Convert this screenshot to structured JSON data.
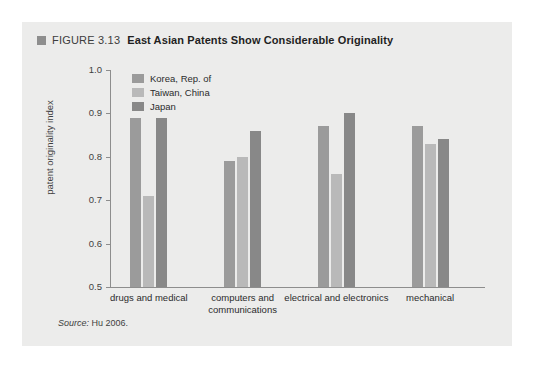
{
  "figure": {
    "label": "FIGURE 3.13",
    "title": "East Asian Patents Show Considerable Originality",
    "marker_color": "#8e8e8e"
  },
  "source": {
    "prefix": "Source:",
    "text": "Hu 2006."
  },
  "colors": {
    "panel_background": "#ececeb",
    "page_background": "#ffffff",
    "axis": "#8d8d8d",
    "korea": "#9b9b9b",
    "taiwan": "#b9b9b9",
    "japan": "#888888"
  },
  "chart_data": {
    "type": "bar",
    "title": "East Asian Patents Show Considerable Originality",
    "xlabel": "",
    "ylabel": "patent originality index",
    "ylim": [
      0.5,
      1.0
    ],
    "yticks": [
      "1.0",
      "0.9",
      "0.8",
      "0.7",
      "0.6",
      "0.5"
    ],
    "ytick_values": [
      1.0,
      0.9,
      0.8,
      0.7,
      0.6,
      0.5
    ],
    "grid": false,
    "legend_position": "top-left inside",
    "categories": [
      "drugs and medical",
      "computers and communications",
      "electrical and electronics",
      "mechanical"
    ],
    "series": [
      {
        "name": "Korea, Rep. of",
        "color": "#9b9b9b",
        "values": [
          0.89,
          0.79,
          0.87,
          0.87
        ]
      },
      {
        "name": "Taiwan, China",
        "color": "#b9b9b9",
        "values": [
          0.71,
          0.8,
          0.76,
          0.83
        ]
      },
      {
        "name": "Japan",
        "color": "#888888",
        "values": [
          0.89,
          0.86,
          0.9,
          0.84
        ]
      }
    ]
  }
}
